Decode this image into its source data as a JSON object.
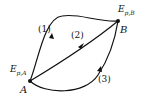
{
  "diagram": {
    "points": [
      {
        "id": "A",
        "label": "A",
        "energy_main": "E",
        "energy_sub": "p,A"
      },
      {
        "id": "B",
        "label": "B",
        "energy_main": "E",
        "energy_sub": "p,B"
      }
    ],
    "paths": [
      {
        "id": "1",
        "label": "(1)"
      },
      {
        "id": "2",
        "label": "(2)"
      },
      {
        "id": "3",
        "label": "(3)"
      }
    ]
  }
}
